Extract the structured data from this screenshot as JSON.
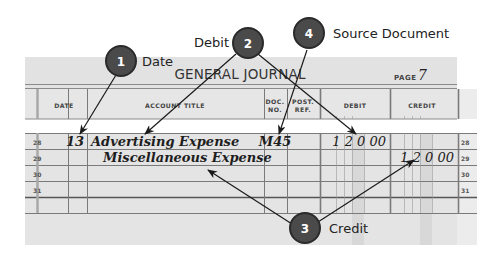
{
  "journal": {
    "title": "GENERAL JOURNAL",
    "page_label": "PAGE",
    "page_number": "7",
    "columns": {
      "date": "DATE",
      "account_title": "ACCOUNT TITLE",
      "doc_no_line1": "DOC.",
      "doc_no_line2": "NO.",
      "post_ref_line1": "POST.",
      "post_ref_line2": "REF.",
      "debit": "DEBIT",
      "credit": "CREDIT"
    },
    "rows": [
      {
        "line": "28",
        "date": "13",
        "account": "Advertising Expense",
        "doc": "M45",
        "debit": "1 2 0 00",
        "credit": ""
      },
      {
        "line": "29",
        "date": "",
        "account": "Miscellaneous Expense",
        "doc": "",
        "debit": "",
        "credit": "1 2 0 00"
      },
      {
        "line": "30",
        "date": "",
        "account": "",
        "doc": "",
        "debit": "",
        "credit": ""
      },
      {
        "line": "31",
        "date": "",
        "account": "",
        "doc": "",
        "debit": "",
        "credit": ""
      }
    ]
  },
  "callouts": [
    {
      "number": "1",
      "label": "Date"
    },
    {
      "number": "2",
      "label": "Debit"
    },
    {
      "number": "3",
      "label": "Credit"
    },
    {
      "number": "4",
      "label": "Source Document"
    }
  ],
  "colors": {
    "badge_fill": "#4a4a4a",
    "badge_ring": "#2a2a2a",
    "paper": "#e4e4e4",
    "line": "#7a7a7a",
    "arrow": "#1a1a1a"
  }
}
